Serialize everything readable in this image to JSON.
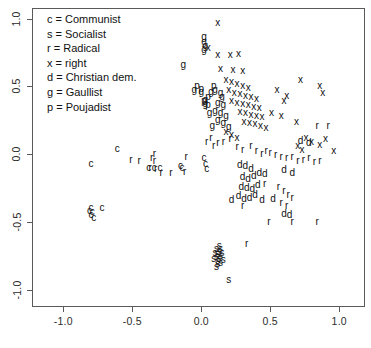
{
  "chart_data": {
    "type": "scatter",
    "title": "",
    "xlabel": "",
    "ylabel": "",
    "xlim": [
      -1.22,
      1.18
    ],
    "ylim": [
      -1.12,
      1.07
    ],
    "grid": false,
    "legend_position": "top-left",
    "marker_style": "text-letter",
    "xticks": [
      "-1.0",
      "-0.5",
      "0.0",
      "0.5",
      "1.0"
    ],
    "xtick_values": [
      -1.0,
      -0.5,
      0.0,
      0.5,
      1.0
    ],
    "yticks": [
      "1.0",
      "0.5",
      "0.0",
      "-0.5",
      "-1.0"
    ],
    "ytick_values": [
      1.0,
      0.5,
      0.0,
      -0.5,
      -1.0
    ],
    "legend": [
      {
        "symbol": "c",
        "label": "c = Communist"
      },
      {
        "symbol": "s",
        "label": "s = Socialist"
      },
      {
        "symbol": "r",
        "label": "r = Radical"
      },
      {
        "symbol": "x",
        "label": "x = right"
      },
      {
        "symbol": "d",
        "label": "d = Christian dem."
      },
      {
        "symbol": "g",
        "label": "g = Gaullist"
      },
      {
        "symbol": "p",
        "label": "p = Poujadist"
      }
    ],
    "series": [
      {
        "name": "Communist",
        "symbol": "c",
        "points": [
          [
            -0.61,
            0.04
          ],
          [
            -0.8,
            -0.07
          ],
          [
            -0.38,
            -0.1
          ],
          [
            -0.34,
            -0.1
          ],
          [
            -0.3,
            -0.1
          ],
          [
            -0.15,
            -0.09
          ],
          [
            -0.14,
            -0.1
          ],
          [
            0.02,
            -0.03
          ],
          [
            0.03,
            -0.07
          ],
          [
            0.04,
            -0.11
          ],
          [
            -0.8,
            -0.4
          ],
          [
            -0.79,
            -0.43
          ],
          [
            -0.8,
            -0.45
          ],
          [
            -0.78,
            -0.47
          ],
          [
            -0.81,
            -0.42
          ],
          [
            -0.72,
            -0.4
          ]
        ]
      },
      {
        "name": "Socialist",
        "symbol": "s",
        "points": [
          [
            0.11,
            -0.7
          ],
          [
            0.13,
            -0.72
          ],
          [
            0.12,
            -0.74
          ],
          [
            0.14,
            -0.75
          ],
          [
            0.11,
            -0.76
          ],
          [
            0.13,
            -0.77
          ],
          [
            0.12,
            -0.79
          ],
          [
            0.14,
            -0.8
          ],
          [
            0.1,
            -0.73
          ],
          [
            0.15,
            -0.73
          ],
          [
            0.12,
            -0.81
          ],
          [
            0.13,
            -0.68
          ],
          [
            0.16,
            -0.78
          ],
          [
            0.09,
            -0.77
          ],
          [
            0.14,
            -0.7
          ],
          [
            0.11,
            -0.83
          ],
          [
            0.2,
            -0.93
          ]
        ]
      },
      {
        "name": "Radical",
        "symbol": "r",
        "points": [
          [
            -0.34,
            0.0
          ],
          [
            -0.51,
            -0.04
          ],
          [
            -0.45,
            -0.05
          ],
          [
            -0.36,
            -0.03
          ],
          [
            -0.34,
            -0.05
          ],
          [
            -0.37,
            -0.1
          ],
          [
            -0.33,
            -0.11
          ],
          [
            -0.29,
            -0.14
          ],
          [
            -0.22,
            -0.14
          ],
          [
            -0.11,
            -0.02
          ],
          [
            -0.12,
            -0.13
          ],
          [
            0.04,
            0.09
          ],
          [
            0.07,
            0.12
          ],
          [
            0.09,
            0.06
          ],
          [
            0.12,
            0.08
          ],
          [
            0.16,
            0.09
          ],
          [
            0.21,
            0.11
          ],
          [
            0.26,
            0.05
          ],
          [
            0.3,
            0.03
          ],
          [
            0.36,
            0.06
          ],
          [
            0.4,
            0.02
          ],
          [
            0.44,
            0.0
          ],
          [
            0.47,
            0.02
          ],
          [
            0.5,
            0.01
          ],
          [
            0.54,
            -0.01
          ],
          [
            0.58,
            -0.02
          ],
          [
            0.62,
            -0.03
          ],
          [
            0.66,
            -0.02
          ],
          [
            0.7,
            -0.05
          ],
          [
            0.74,
            -0.04
          ],
          [
            0.78,
            -0.03
          ],
          [
            0.82,
            -0.06
          ],
          [
            0.86,
            -0.05
          ],
          [
            0.84,
            0.21
          ],
          [
            0.92,
            0.21
          ],
          [
            0.46,
            -0.22
          ],
          [
            0.56,
            -0.24
          ],
          [
            0.6,
            -0.27
          ],
          [
            0.63,
            -0.3
          ],
          [
            0.66,
            -0.32
          ],
          [
            0.58,
            -0.36
          ],
          [
            0.62,
            -0.38
          ],
          [
            0.49,
            -0.5
          ],
          [
            0.66,
            -0.5
          ],
          [
            0.84,
            -0.5
          ],
          [
            0.3,
            -0.38
          ],
          [
            0.33,
            -0.66
          ]
        ]
      },
      {
        "name": "right",
        "symbol": "x",
        "points": [
          [
            0.12,
            0.97
          ],
          [
            0.05,
            0.78
          ],
          [
            0.12,
            0.73
          ],
          [
            0.21,
            0.73
          ],
          [
            0.27,
            0.74
          ],
          [
            0.14,
            0.63
          ],
          [
            0.23,
            0.62
          ],
          [
            0.3,
            0.61
          ],
          [
            0.18,
            0.55
          ],
          [
            0.22,
            0.53
          ],
          [
            0.26,
            0.52
          ],
          [
            0.3,
            0.5
          ],
          [
            0.34,
            0.49
          ],
          [
            0.2,
            0.47
          ],
          [
            0.24,
            0.45
          ],
          [
            0.28,
            0.44
          ],
          [
            0.32,
            0.43
          ],
          [
            0.36,
            0.42
          ],
          [
            0.4,
            0.41
          ],
          [
            0.22,
            0.39
          ],
          [
            0.26,
            0.38
          ],
          [
            0.3,
            0.37
          ],
          [
            0.34,
            0.36
          ],
          [
            0.38,
            0.35
          ],
          [
            0.42,
            0.34
          ],
          [
            0.28,
            0.31
          ],
          [
            0.32,
            0.3
          ],
          [
            0.36,
            0.29
          ],
          [
            0.4,
            0.28
          ],
          [
            0.44,
            0.27
          ],
          [
            0.31,
            0.24
          ],
          [
            0.35,
            0.23
          ],
          [
            0.39,
            0.22
          ],
          [
            0.43,
            0.21
          ],
          [
            0.47,
            0.19
          ],
          [
            0.55,
            0.47
          ],
          [
            0.62,
            0.43
          ],
          [
            0.6,
            0.39
          ],
          [
            0.72,
            0.55
          ],
          [
            0.86,
            0.5
          ],
          [
            0.88,
            0.45
          ],
          [
            0.51,
            0.3
          ],
          [
            0.58,
            0.28
          ],
          [
            0.69,
            0.24
          ],
          [
            0.76,
            0.12
          ],
          [
            0.8,
            0.09
          ],
          [
            0.86,
            0.07
          ],
          [
            0.9,
            0.11
          ],
          [
            0.96,
            0.02
          ],
          [
            0.7,
            0.06
          ],
          [
            0.73,
            0.03
          ],
          [
            0.18,
            0.16
          ],
          [
            0.22,
            0.14
          ],
          [
            0.26,
            0.12
          ]
        ]
      },
      {
        "name": "Christian dem.",
        "symbol": "d",
        "points": [
          [
            0.28,
            -0.08
          ],
          [
            0.32,
            -0.09
          ],
          [
            0.36,
            -0.11
          ],
          [
            0.3,
            -0.17
          ],
          [
            0.34,
            -0.18
          ],
          [
            0.38,
            -0.16
          ],
          [
            0.42,
            -0.14
          ],
          [
            0.46,
            -0.15
          ],
          [
            0.29,
            -0.24
          ],
          [
            0.33,
            -0.25
          ],
          [
            0.37,
            -0.26
          ],
          [
            0.41,
            -0.23
          ],
          [
            0.27,
            -0.31
          ],
          [
            0.31,
            -0.33
          ],
          [
            0.35,
            -0.32
          ],
          [
            0.39,
            -0.3
          ],
          [
            0.22,
            -0.34
          ],
          [
            0.44,
            -0.34
          ],
          [
            0.52,
            -0.33
          ],
          [
            0.6,
            -0.12
          ],
          [
            0.66,
            -0.14
          ],
          [
            0.72,
            0.1
          ],
          [
            0.78,
            0.08
          ],
          [
            0.6,
            -0.44
          ],
          [
            0.64,
            -0.45
          ]
        ]
      },
      {
        "name": "Gaullist",
        "symbol": "g",
        "points": [
          [
            0.02,
            0.86
          ],
          [
            0.02,
            0.83
          ],
          [
            0.03,
            0.8
          ],
          [
            0.02,
            0.77
          ],
          [
            -0.13,
            0.66
          ],
          [
            -0.05,
            0.47
          ],
          [
            0.0,
            0.46
          ],
          [
            0.07,
            0.46
          ],
          [
            0.03,
            0.4
          ],
          [
            0.03,
            0.37
          ],
          [
            0.1,
            0.47
          ],
          [
            0.14,
            0.45
          ],
          [
            0.15,
            0.42
          ],
          [
            0.12,
            0.38
          ],
          [
            0.16,
            0.36
          ],
          [
            0.1,
            0.32
          ],
          [
            0.14,
            0.3
          ],
          [
            0.18,
            0.28
          ],
          [
            0.12,
            0.25
          ],
          [
            0.16,
            0.23
          ],
          [
            0.08,
            0.21
          ],
          [
            0.2,
            0.2
          ],
          [
            0.06,
            0.3
          ]
        ]
      },
      {
        "name": "Poujadist",
        "symbol": "p",
        "points": [
          [
            -0.03,
            0.5
          ],
          [
            0.0,
            0.48
          ],
          [
            0.09,
            0.5
          ],
          [
            0.05,
            0.42
          ],
          [
            0.02,
            0.39
          ],
          [
            0.05,
            0.36
          ]
        ]
      }
    ]
  }
}
